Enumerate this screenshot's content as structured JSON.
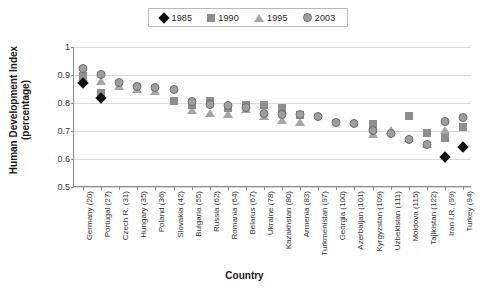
{
  "chart_data": {
    "type": "scatter",
    "title": "",
    "xlabel": "Country",
    "ylabel": "Human Development Index (percentage)",
    "ylim": [
      0.5,
      1
    ],
    "yticks": [
      "0.5",
      "0.6",
      "0.7",
      "0.8",
      "0.9",
      "1"
    ],
    "ytick_values": [
      0.5,
      0.6,
      0.7,
      0.8,
      0.9,
      1.0
    ],
    "grid": true,
    "legend_position": "top-center",
    "categories": [
      "Germany (20)",
      "Portugal (27)",
      "Czech R. (31)",
      "Hungary (35)",
      "Poland (36)",
      "Slovakia (42)",
      "Bulgaria (55)",
      "Russia (62)",
      "Romania (64)",
      "Belarus (67)",
      "Ukraine (78)",
      "Kazakhstan (80)",
      "Armenia (83)",
      "Turkmenistan (97)",
      "Georgia (100)",
      "Azerbaijan (101)",
      "Kyrgyzstan (109)",
      "Uzbekistan (111)",
      "Moldova (115)",
      "Tajikistan (122)",
      "Iran I.R. (99)",
      "Turkey (94)"
    ],
    "series": [
      {
        "name": "1985",
        "marker": "diamond",
        "color": "#111111",
        "values": [
          0.875,
          0.822,
          null,
          null,
          null,
          null,
          null,
          null,
          null,
          null,
          null,
          null,
          null,
          null,
          null,
          null,
          null,
          null,
          null,
          null,
          0.611,
          0.645
        ]
      },
      {
        "name": "1990",
        "marker": "square",
        "color": "#8e8e8e",
        "values": [
          0.9,
          0.84,
          null,
          null,
          null,
          0.811,
          0.797,
          0.812,
          0.784,
          0.795,
          0.798,
          0.784,
          0.76,
          null,
          null,
          null,
          0.73,
          null,
          0.757,
          0.698,
          0.68,
          0.718
        ]
      },
      {
        "name": "1995",
        "marker": "triangle",
        "color": "#a6a6a6",
        "values": [
          0.9,
          0.884,
          0.869,
          0.858,
          0.851,
          null,
          0.781,
          0.772,
          0.768,
          0.786,
          0.76,
          0.748,
          0.741,
          null,
          null,
          null,
          0.698,
          0.709,
          0.681,
          0.661,
          0.71,
          null
        ]
      },
      {
        "name": "2003",
        "marker": "circle",
        "color": "#9e9e9e",
        "values": [
          0.925,
          0.904,
          0.874,
          0.862,
          0.858,
          0.849,
          0.808,
          0.795,
          0.792,
          0.786,
          0.766,
          0.761,
          0.759,
          0.752,
          0.732,
          0.729,
          0.702,
          0.694,
          0.671,
          0.652,
          0.736,
          0.75
        ]
      }
    ]
  },
  "legend": {
    "items": [
      {
        "label": "1985",
        "marker": "diamond"
      },
      {
        "label": "1990",
        "marker": "square"
      },
      {
        "label": "1995",
        "marker": "triangle"
      },
      {
        "label": "2003",
        "marker": "circle"
      }
    ]
  }
}
